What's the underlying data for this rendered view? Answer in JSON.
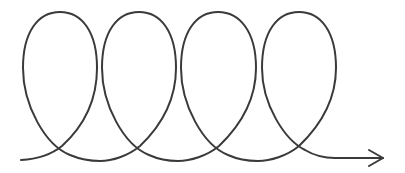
{
  "diagram": {
    "type": "looping-spiral-arrow",
    "loop_count": 4,
    "stroke_color": "#3a3a3a",
    "background_color": "#ffffff",
    "stroke_width": 2,
    "icons": {
      "arrowhead": "arrowhead-right-icon"
    }
  }
}
